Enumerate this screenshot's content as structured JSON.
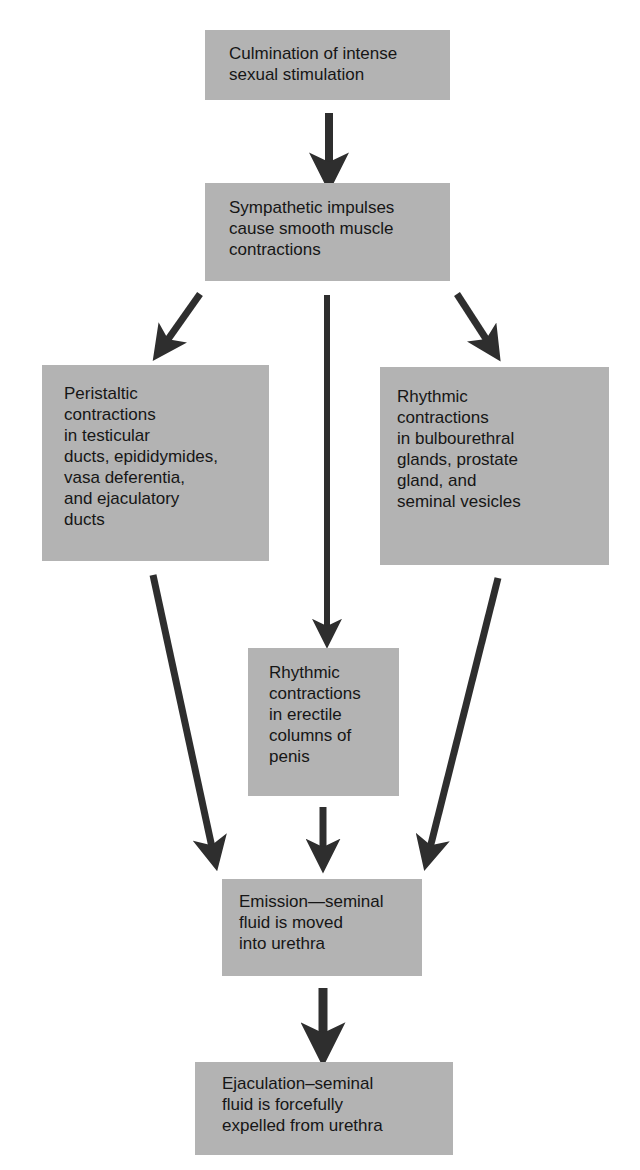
{
  "diagram": {
    "type": "flowchart",
    "nodes": {
      "culmination": "Culmination of intense\nsexual stimulation",
      "sympathetic": "Sympathetic impulses\ncause smooth muscle\ncontractions",
      "peristaltic": "Peristaltic\ncontractions\nin testicular\nducts, epididymides,\nvasa deferentia,\nand ejaculatory\nducts",
      "rhythmic_glands": "Rhythmic\ncontractions\nin bulbourethral\nglands, prostate\ngland, and\nseminal vesicles",
      "rhythmic_penis": "Rhythmic\ncontractions\nin erectile\ncolumns of\npenis",
      "emission": "Emission—seminal\nfluid is moved\ninto urethra",
      "ejaculation": "Ejaculation–seminal\nfluid is forcefully\nexpelled from urethra"
    },
    "edges": [
      {
        "from": "culmination",
        "to": "sympathetic"
      },
      {
        "from": "sympathetic",
        "to": "peristaltic"
      },
      {
        "from": "sympathetic",
        "to": "rhythmic_penis"
      },
      {
        "from": "sympathetic",
        "to": "rhythmic_glands"
      },
      {
        "from": "peristaltic",
        "to": "emission"
      },
      {
        "from": "rhythmic_penis",
        "to": "emission"
      },
      {
        "from": "rhythmic_glands",
        "to": "emission"
      },
      {
        "from": "emission",
        "to": "ejaculation"
      }
    ],
    "colors": {
      "box_fill": "#b3b3b3",
      "arrow": "#2e2e2e",
      "text": "#161616",
      "background": "#ffffff"
    }
  }
}
